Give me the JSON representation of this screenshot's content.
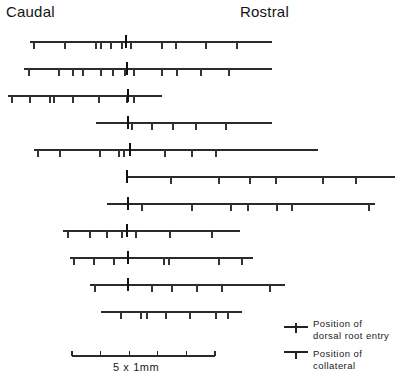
{
  "figure": {
    "title_left": "Caudal",
    "title_right": "Rostral",
    "orientation_note": "horizontal axon reconstructions, caudal at left, rostral at right"
  },
  "legend": {
    "dorsal_root_entry": {
      "line1": "Position of",
      "line2": "dorsal root entry",
      "glyph": "tick-crossing-line-icon"
    },
    "collateral": {
      "line1": "Position of",
      "line2": "collateral",
      "glyph": "tick-below-line-icon"
    }
  },
  "scale_bar": {
    "label": "5 x 1mm",
    "divisions": 5,
    "unit": "mm",
    "per_division": 1,
    "x_start": 72,
    "x_end": 215,
    "y": 356
  },
  "colors": {
    "ink": "#2a2a2a",
    "text": "#1a1a1a",
    "background": "#ffffff"
  },
  "chart_data": {
    "type": "scatter",
    "xlabel": "Rostro-caudal position (mm)",
    "ylabel": "Axon",
    "grid": false,
    "legend_position": "bottom-right",
    "axis_note": "x axis in pixels of original figure; 143 px = 5 mm",
    "px_per_mm": 28.6,
    "series": [
      {
        "name": "axon-1",
        "y": 42,
        "x_start": 30,
        "x_end": 272,
        "dorsal_root_entry": 126,
        "collaterals": [
          34,
          65,
          96,
          101,
          111,
          122,
          131,
          162,
          176,
          206,
          237
        ]
      },
      {
        "name": "axon-2",
        "y": 69,
        "x_start": 24,
        "x_end": 272,
        "dorsal_root_entry": 127,
        "collaterals": [
          29,
          59,
          73,
          83,
          101,
          113,
          125,
          134,
          162,
          177,
          201,
          229
        ]
      },
      {
        "name": "axon-3",
        "y": 96,
        "x_start": 8,
        "x_end": 162,
        "dorsal_root_entry": 128,
        "collaterals": [
          12,
          30,
          50,
          54,
          73,
          99,
          127,
          134
        ]
      },
      {
        "name": "axon-4",
        "y": 123,
        "x_start": 96,
        "x_end": 272,
        "dorsal_root_entry": 128,
        "collaterals": [
          132,
          152,
          173,
          196,
          226
        ]
      },
      {
        "name": "axon-5",
        "y": 150,
        "x_start": 34,
        "x_end": 318,
        "dorsal_root_entry": 130,
        "collaterals": [
          38,
          60,
          100,
          119,
          124,
          165,
          192,
          216
        ]
      },
      {
        "name": "axon-6",
        "y": 177,
        "x_start": 126,
        "x_end": 395,
        "dorsal_root_entry": 127,
        "collaterals": [
          171,
          219,
          250,
          276,
          323,
          356
        ]
      },
      {
        "name": "axon-7",
        "y": 204,
        "x_start": 107,
        "x_end": 375,
        "dorsal_root_entry": 128,
        "collaterals": [
          142,
          192,
          231,
          248,
          277,
          292,
          369
        ]
      },
      {
        "name": "axon-8",
        "y": 231,
        "x_start": 63,
        "x_end": 240,
        "dorsal_root_entry": 127,
        "collaterals": [
          68,
          90,
          107,
          122,
          136,
          170,
          212
        ]
      },
      {
        "name": "axon-9",
        "y": 258,
        "x_start": 70,
        "x_end": 253,
        "dorsal_root_entry": 128,
        "collaterals": [
          74,
          94,
          114,
          164,
          169,
          219,
          242
        ]
      },
      {
        "name": "axon-10",
        "y": 285,
        "x_start": 90,
        "x_end": 285,
        "dorsal_root_entry": 128,
        "collaterals": [
          95,
          152,
          172,
          197,
          222,
          270
        ]
      },
      {
        "name": "axon-11",
        "y": 312,
        "x_start": 101,
        "x_end": 242,
        "dorsal_root_entry": null,
        "collaterals": [
          121,
          141,
          147,
          166,
          190,
          216,
          228
        ]
      }
    ]
  }
}
